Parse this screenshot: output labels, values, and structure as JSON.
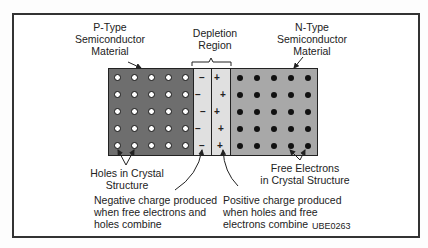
{
  "diagram": {
    "labels": {
      "p_type": "P-Type\nSemiconductor\nMaterial",
      "n_type": "N-Type\nSemiconductor\nMaterial",
      "depletion": "Depletion\nRegion",
      "holes": "Holes in Crystal\nStructure",
      "electrons": "Free Electrons\nin Crystal Structure",
      "negative_charge": "Negative charge produced\nwhen free electrons and\nholes combine",
      "positive_charge": "Positive charge produced\nwhen holes and free\nelectrons combine",
      "figure_id": "UBE0263"
    },
    "regions": [
      {
        "name": "P-Type",
        "carrier": "holes",
        "rows": 5,
        "cols": 5,
        "color": "#6e6e6e"
      },
      {
        "name": "Depletion negative",
        "sign": "-",
        "count": 5,
        "color": "#e0e0e0"
      },
      {
        "name": "Depletion positive",
        "sign": "+",
        "count": 5,
        "color": "#e0e0e0"
      },
      {
        "name": "N-Type",
        "carrier": "free electrons",
        "rows": 5,
        "cols": 5,
        "color": "#a8a8a8"
      }
    ],
    "signs": {
      "negative": "–",
      "positive": "+"
    }
  }
}
